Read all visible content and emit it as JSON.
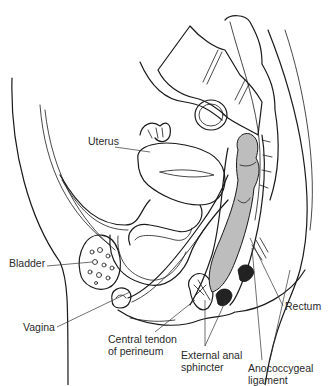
{
  "figure": {
    "type": "anatomical-diagram",
    "labels": [
      {
        "id": "uterus",
        "text": "Uterus",
        "x": 88,
        "y": 141
      },
      {
        "id": "bladder",
        "text": "Bladder",
        "x": 9,
        "y": 263
      },
      {
        "id": "vagina",
        "text": "Vagina",
        "x": 23,
        "y": 323
      },
      {
        "id": "central-tendon",
        "lines": [
          "Central tendon",
          "of perineum"
        ],
        "x": 108,
        "y": 333
      },
      {
        "id": "rectum",
        "text": "Rectum",
        "x": 285,
        "y": 304
      },
      {
        "id": "external-anal-sphincter",
        "lines": [
          "External anal",
          "sphincter"
        ],
        "x": 181,
        "y": 349
      },
      {
        "id": "anococcygeal-ligament",
        "lines": [
          "Anococcygeal",
          "ligament"
        ],
        "x": 248,
        "y": 362
      }
    ]
  },
  "colors": {
    "line": "#1a1a1a",
    "rectum_fill": "#bdbdbd",
    "sphincter_fill": "#222222",
    "background": "#ffffff"
  }
}
